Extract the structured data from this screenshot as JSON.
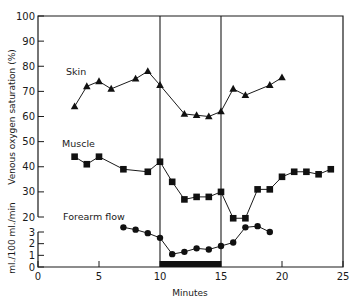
{
  "chart_data": {
    "type": "line",
    "title": "",
    "xlabel": "Minutes",
    "ylabel": "Venous oxygen saturation (%)",
    "ylabel_secondary": "ml./100 ml./min",
    "xlim": [
      0,
      25
    ],
    "ylim": [
      20,
      100
    ],
    "ylim_secondary": [
      0,
      3
    ],
    "x_ticks": [
      0,
      5,
      10,
      15,
      20,
      25
    ],
    "y_ticks": [
      100,
      90,
      80,
      70,
      60,
      50,
      40,
      30,
      20
    ],
    "y_ticks_secondary": [
      3,
      2,
      1,
      0
    ],
    "grid": false,
    "legend": "inline labels",
    "annotations": [
      {
        "type": "vertical-line",
        "x": 10
      },
      {
        "type": "vertical-line",
        "x": 15
      },
      {
        "type": "black-bar",
        "x_start": 10,
        "x_end": 15,
        "description": "stimulus period"
      }
    ],
    "series": [
      {
        "name": "Skin",
        "marker": "triangle",
        "axis": "venous oxygen saturation (%)",
        "x": [
          3,
          4,
          5,
          6,
          8,
          9,
          10,
          12,
          13,
          14,
          15,
          16,
          17,
          19,
          20
        ],
        "values": [
          64,
          72,
          74,
          71,
          75,
          78,
          72.5,
          61,
          60.5,
          60,
          62,
          71,
          68.5,
          72.5,
          75.5
        ]
      },
      {
        "name": "Muscle",
        "marker": "square",
        "axis": "venous oxygen saturation (%)",
        "x": [
          3,
          4,
          5,
          7,
          9,
          10,
          11,
          12,
          13,
          14,
          15,
          16,
          17,
          18,
          19,
          20,
          21,
          22,
          23,
          24
        ],
        "values": [
          44,
          41,
          44,
          39,
          38,
          42,
          34,
          27,
          28,
          28,
          30,
          19.5,
          19.5,
          31,
          31,
          36,
          38,
          38,
          37,
          39
        ]
      },
      {
        "name": "Forearm flow",
        "marker": "circle",
        "axis": "ml./100 ml./min",
        "x": [
          7,
          8,
          9,
          10,
          11,
          12,
          13,
          14,
          15,
          16,
          17,
          18,
          19
        ],
        "values": [
          3.4,
          3.2,
          2.9,
          2.5,
          1.1,
          1.3,
          1.6,
          1.5,
          1.8,
          2.1,
          3.4,
          3.5,
          3.0
        ]
      }
    ]
  },
  "labels": {
    "xlabel": "Minutes",
    "ylabel": "Venous oxygen saturation (%)",
    "ylabel_secondary": "ml./100 ml./min",
    "skin": "Skin",
    "muscle": "Muscle",
    "flow": "Forearm flow"
  }
}
